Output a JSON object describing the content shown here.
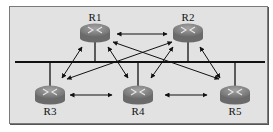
{
  "diagram": {
    "type": "network-topology",
    "background": "#e2e2e2",
    "router_color": "#8a8a8a",
    "line_color": "#111111",
    "bus": {
      "y": 62,
      "x1": 15,
      "x2": 265
    },
    "routers": [
      {
        "id": "R1",
        "label": "R1",
        "cx": 95,
        "cy": 33,
        "label_y": 12,
        "drop": 1
      },
      {
        "id": "R2",
        "label": "R2",
        "cx": 188,
        "cy": 33,
        "label_y": 12,
        "drop": 1
      },
      {
        "id": "R3",
        "label": "R3",
        "cx": 50,
        "cy": 95,
        "label_y": 106,
        "drop": -1
      },
      {
        "id": "R4",
        "label": "R4",
        "cx": 138,
        "cy": 95,
        "label_y": 106,
        "drop": -1
      },
      {
        "id": "R5",
        "label": "R5",
        "cx": 235,
        "cy": 95,
        "label_y": 106,
        "drop": -1
      }
    ],
    "adjacencies": [
      {
        "from": "R1",
        "to": "R2",
        "x1": 117,
        "y1": 34,
        "x2": 167,
        "y2": 34
      },
      {
        "from": "R3",
        "to": "R4",
        "x1": 70,
        "y1": 95,
        "x2": 112,
        "y2": 95
      },
      {
        "from": "R4",
        "to": "R5",
        "x1": 165,
        "y1": 95,
        "x2": 207,
        "y2": 95
      },
      {
        "from": "R1",
        "to": "R3",
        "x1": 82,
        "y1": 47,
        "x2": 62,
        "y2": 78
      },
      {
        "from": "R2",
        "to": "R5",
        "x1": 200,
        "y1": 47,
        "x2": 220,
        "y2": 78
      },
      {
        "from": "R1",
        "to": "R4",
        "x1": 108,
        "y1": 47,
        "x2": 128,
        "y2": 78
      },
      {
        "from": "R2",
        "to": "R4",
        "x1": 173,
        "y1": 47,
        "x2": 151,
        "y2": 78
      },
      {
        "from": "R2",
        "to": "R3",
        "x1": 172,
        "y1": 42,
        "x2": 67,
        "y2": 79
      },
      {
        "from": "R1",
        "to": "R5",
        "x1": 113,
        "y1": 42,
        "x2": 219,
        "y2": 79
      }
    ]
  }
}
